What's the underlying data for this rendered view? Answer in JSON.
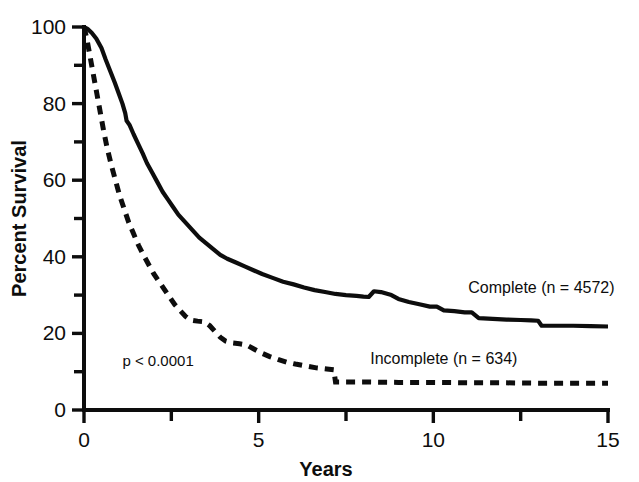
{
  "chart_data": {
    "type": "line",
    "title": "",
    "subtitle": "",
    "xlabel": "Years",
    "ylabel": "Percent Survival",
    "xlim": [
      0,
      15
    ],
    "ylim": [
      0,
      100
    ],
    "grid": false,
    "legend_position": "inline-right",
    "x_ticks_major": [
      0,
      5,
      10,
      15
    ],
    "x_ticks_minor": [
      2.5,
      7.5,
      12.5
    ],
    "x_tick_labels": [
      "0",
      "5",
      "10",
      "15"
    ],
    "y_ticks_major": [
      0,
      20,
      40,
      60,
      80,
      100
    ],
    "y_ticks_minor": [
      10,
      30,
      50,
      70,
      90
    ],
    "y_tick_labels": [
      "0",
      "20",
      "40",
      "60",
      "80",
      "100"
    ],
    "annotations": [
      {
        "name": "p-value",
        "text": "p < 0.0001",
        "x": 1.1,
        "y": 11.5
      }
    ],
    "series": [
      {
        "name": "Complete",
        "label": "Complete (n = 4572)",
        "n": 4572,
        "style": "solid",
        "label_x": 11.0,
        "label_y": 30.5,
        "points": [
          [
            0.0,
            100
          ],
          [
            0.1,
            99.5
          ],
          [
            0.22,
            98.5
          ],
          [
            0.35,
            97.0
          ],
          [
            0.5,
            94.5
          ],
          [
            0.62,
            91.5
          ],
          [
            0.75,
            88.5
          ],
          [
            0.88,
            85.5
          ],
          [
            1.0,
            82.5
          ],
          [
            1.1,
            80.0
          ],
          [
            1.18,
            77.5
          ],
          [
            1.22,
            75.5
          ],
          [
            1.3,
            74.5
          ],
          [
            1.42,
            72.0
          ],
          [
            1.55,
            69.5
          ],
          [
            1.68,
            67.0
          ],
          [
            1.8,
            64.5
          ],
          [
            1.95,
            62.0
          ],
          [
            2.1,
            59.5
          ],
          [
            2.25,
            57.0
          ],
          [
            2.4,
            55.0
          ],
          [
            2.55,
            53.0
          ],
          [
            2.7,
            51.0
          ],
          [
            2.85,
            49.5
          ],
          [
            3.0,
            48.0
          ],
          [
            3.15,
            46.5
          ],
          [
            3.3,
            45.0
          ],
          [
            3.5,
            43.5
          ],
          [
            3.7,
            42.0
          ],
          [
            3.9,
            40.5
          ],
          [
            4.1,
            39.5
          ],
          [
            4.35,
            38.5
          ],
          [
            4.6,
            37.5
          ],
          [
            4.85,
            36.5
          ],
          [
            5.1,
            35.5
          ],
          [
            5.4,
            34.5
          ],
          [
            5.7,
            33.5
          ],
          [
            6.0,
            32.8
          ],
          [
            6.3,
            32.0
          ],
          [
            6.6,
            31.3
          ],
          [
            6.9,
            30.8
          ],
          [
            7.2,
            30.3
          ],
          [
            7.5,
            30.0
          ],
          [
            7.8,
            29.8
          ],
          [
            8.0,
            29.6
          ],
          [
            8.15,
            29.5
          ],
          [
            8.3,
            31.0
          ],
          [
            8.5,
            30.8
          ],
          [
            8.8,
            30.0
          ],
          [
            9.0,
            29.0
          ],
          [
            9.3,
            28.2
          ],
          [
            9.6,
            27.6
          ],
          [
            9.9,
            27.0
          ],
          [
            10.1,
            27.0
          ],
          [
            10.3,
            26.0
          ],
          [
            10.6,
            25.8
          ],
          [
            10.9,
            25.5
          ],
          [
            11.1,
            25.5
          ],
          [
            11.3,
            24.0
          ],
          [
            11.7,
            23.8
          ],
          [
            12.1,
            23.6
          ],
          [
            12.5,
            23.5
          ],
          [
            12.8,
            23.4
          ],
          [
            13.0,
            23.3
          ],
          [
            13.1,
            22.0
          ],
          [
            13.5,
            22.0
          ],
          [
            14.0,
            22.0
          ],
          [
            14.5,
            21.9
          ],
          [
            15.0,
            21.8
          ]
        ]
      },
      {
        "name": "Incomplete",
        "label": "Incomplete (n = 634)",
        "n": 634,
        "style": "dashed",
        "label_x": 10.3,
        "label_y": 12.0,
        "points": [
          [
            0.0,
            100
          ],
          [
            0.08,
            97.0
          ],
          [
            0.16,
            93.0
          ],
          [
            0.26,
            88.0
          ],
          [
            0.36,
            83.0
          ],
          [
            0.46,
            78.0
          ],
          [
            0.56,
            73.0
          ],
          [
            0.66,
            68.5
          ],
          [
            0.78,
            64.0
          ],
          [
            0.9,
            60.0
          ],
          [
            1.02,
            56.0
          ],
          [
            1.15,
            52.5
          ],
          [
            1.28,
            49.0
          ],
          [
            1.42,
            46.0
          ],
          [
            1.56,
            43.0
          ],
          [
            1.7,
            40.5
          ],
          [
            1.85,
            38.0
          ],
          [
            2.0,
            35.5
          ],
          [
            2.15,
            33.5
          ],
          [
            2.3,
            31.5
          ],
          [
            2.45,
            29.5
          ],
          [
            2.6,
            27.5
          ],
          [
            2.75,
            26.0
          ],
          [
            2.9,
            24.5
          ],
          [
            3.05,
            23.5
          ],
          [
            3.25,
            23.2
          ],
          [
            3.45,
            23.0
          ],
          [
            3.6,
            22.0
          ],
          [
            3.75,
            20.5
          ],
          [
            3.9,
            19.0
          ],
          [
            4.05,
            18.0
          ],
          [
            4.25,
            17.5
          ],
          [
            4.45,
            17.3
          ],
          [
            4.65,
            17.0
          ],
          [
            4.85,
            16.0
          ],
          [
            5.05,
            15.0
          ],
          [
            5.3,
            14.0
          ],
          [
            5.55,
            13.2
          ],
          [
            5.8,
            12.5
          ],
          [
            6.05,
            12.0
          ],
          [
            6.35,
            11.5
          ],
          [
            6.65,
            11.0
          ],
          [
            6.95,
            10.7
          ],
          [
            7.15,
            10.5
          ],
          [
            7.2,
            7.3
          ],
          [
            7.6,
            7.3
          ],
          [
            8.2,
            7.3
          ],
          [
            9.0,
            7.2
          ],
          [
            10.0,
            7.2
          ],
          [
            11.0,
            7.1
          ],
          [
            12.0,
            7.1
          ],
          [
            13.0,
            7.0
          ],
          [
            14.0,
            7.0
          ],
          [
            15.0,
            7.0
          ]
        ]
      }
    ]
  }
}
